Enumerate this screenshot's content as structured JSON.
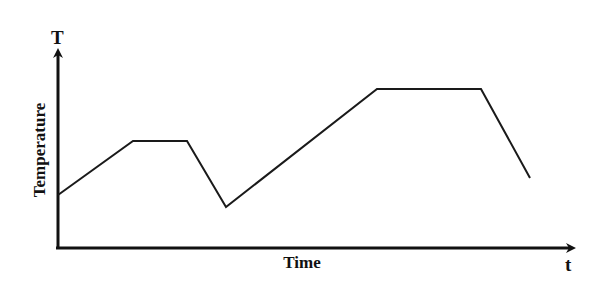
{
  "chart_data": {
    "type": "line",
    "title": "",
    "xlabel": "Time",
    "ylabel": "Temperature",
    "x_axis_symbol": "t",
    "y_axis_symbol": "T",
    "grid": false,
    "legend": null,
    "ticks": {
      "x": [],
      "y": []
    },
    "series": [
      {
        "name": "Temperature profile",
        "points_px": [
          [
            58,
            195
          ],
          [
            133,
            141
          ],
          [
            187,
            141
          ],
          [
            226,
            207
          ],
          [
            377,
            89
          ],
          [
            481,
            89
          ],
          [
            530,
            178
          ]
        ],
        "segments": [
          "rise",
          "plateau",
          "drop",
          "rise",
          "plateau",
          "drop"
        ]
      }
    ],
    "line_color": "#1a1a1a"
  }
}
